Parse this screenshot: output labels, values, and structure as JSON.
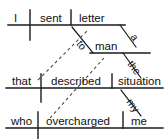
{
  "diagram": {
    "type": "reed-kellogg-sentence-diagram",
    "sentence": "I sent a letter to the man that described the situation who overcharged me",
    "ink_color": "#111111",
    "line_color": "#1a1a1a",
    "dashed_color": "#4a4a4a",
    "background": "#ffffff",
    "clauses": [
      {
        "id": "main-clause",
        "row": 1,
        "words": [
          {
            "id": "subject-i",
            "text": "I",
            "role": "subject"
          },
          {
            "id": "verb-sent",
            "text": "sent",
            "role": "verb"
          },
          {
            "id": "object-letter",
            "text": "letter",
            "role": "direct-object"
          }
        ],
        "modifiers": [
          {
            "id": "article-a",
            "text": "a",
            "role": "article",
            "attaches_to": "letter"
          },
          {
            "id": "prep-to",
            "text": "to",
            "role": "preposition",
            "attaches_to": "sent"
          }
        ]
      },
      {
        "id": "prepositional-phrase",
        "row": 2,
        "words": [
          {
            "id": "object-man",
            "text": "man",
            "role": "object-of-preposition"
          }
        ],
        "modifiers": [
          {
            "id": "article-the-man",
            "text": "the",
            "role": "article",
            "attaches_to": "man"
          }
        ]
      },
      {
        "id": "relative-clause-1",
        "row": 3,
        "words": [
          {
            "id": "rel-that",
            "text": "that",
            "role": "relative-pronoun-subject"
          },
          {
            "id": "verb-described",
            "text": "described",
            "role": "verb"
          },
          {
            "id": "object-situation",
            "text": "situation",
            "role": "direct-object"
          }
        ],
        "modifiers": [
          {
            "id": "poss-my",
            "text": "my",
            "role": "possessive-adjective",
            "attaches_to": "situation"
          }
        ]
      },
      {
        "id": "relative-clause-2",
        "row": 4,
        "words": [
          {
            "id": "rel-who",
            "text": "who",
            "role": "relative-pronoun-subject"
          },
          {
            "id": "verb-overcharged",
            "text": "overcharged",
            "role": "verb"
          },
          {
            "id": "object-me",
            "text": "me",
            "role": "direct-object"
          }
        ],
        "modifiers": []
      }
    ],
    "connectors": [
      {
        "id": "dashed-that-to-man",
        "style": "dashed",
        "from": "that",
        "to": "man"
      },
      {
        "id": "dashed-who-to-situation",
        "style": "dashed",
        "from": "who",
        "to": "situation"
      }
    ]
  }
}
